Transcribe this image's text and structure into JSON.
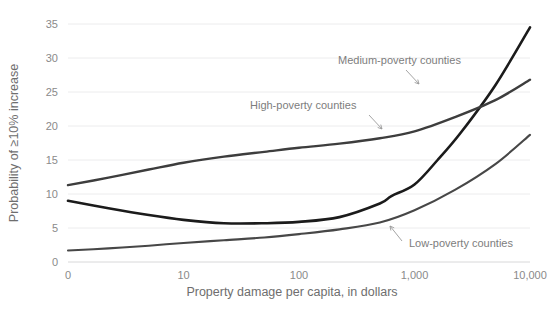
{
  "chart_data": {
    "type": "line",
    "title": "",
    "xlabel": "Property damage per capita, in dollars",
    "ylabel": "Probability of ≥10% increase",
    "x_tick_labels": [
      "0",
      "10",
      "100",
      "1,000",
      "10,000"
    ],
    "x_tick_positions": [
      0,
      1,
      2,
      3,
      4
    ],
    "y_tick_labels": [
      "0",
      "5",
      "10",
      "15",
      "20",
      "25",
      "30",
      "35"
    ],
    "ylim": [
      0,
      35
    ],
    "xlim": [
      0,
      4
    ],
    "grid": "horizontal",
    "legend": "annotations-inline",
    "series": [
      {
        "name": "High-poverty counties",
        "color": "#1b1b1b",
        "width": 2.6,
        "x": [
          0.0,
          0.35,
          0.7,
          1.0,
          1.35,
          1.7,
          2.0,
          2.35,
          2.7,
          2.8,
          3.0,
          3.2,
          3.4,
          3.7,
          4.0
        ],
        "values": [
          9.0,
          7.9,
          6.9,
          6.2,
          5.7,
          5.7,
          5.9,
          6.6,
          8.6,
          9.7,
          11.4,
          15.0,
          19.0,
          26.0,
          34.5
        ]
      },
      {
        "name": "Medium-poverty counties",
        "color": "#3d3d3d",
        "width": 2.4,
        "x": [
          0.0,
          0.35,
          0.7,
          1.0,
          1.35,
          1.7,
          2.0,
          2.35,
          2.7,
          3.0,
          3.35,
          3.7,
          4.0
        ],
        "values": [
          11.3,
          12.4,
          13.6,
          14.6,
          15.5,
          16.2,
          16.8,
          17.4,
          18.2,
          19.2,
          21.3,
          23.8,
          26.8
        ]
      },
      {
        "name": "Low-poverty counties",
        "color": "#474747",
        "width": 2.1,
        "x": [
          0.0,
          0.35,
          0.7,
          1.0,
          1.35,
          1.7,
          2.0,
          2.35,
          2.7,
          3.0,
          3.35,
          3.7,
          4.0
        ],
        "values": [
          1.7,
          2.0,
          2.4,
          2.8,
          3.2,
          3.6,
          4.1,
          4.8,
          5.8,
          7.6,
          10.6,
          14.4,
          18.7
        ]
      }
    ],
    "annotations": [
      {
        "id": "medium",
        "label": "Medium-poverty counties",
        "text_x": 338,
        "text_y": 64,
        "leader": "M 406 70 L 419 84"
      },
      {
        "id": "high",
        "label": "High-poverty counties",
        "text_x": 250,
        "text_y": 109,
        "leader": "M 369 115 L 382 129"
      },
      {
        "id": "low",
        "label": "Low-poverty counties",
        "text_x": 409,
        "text_y": 247,
        "leader": "M 402 241 L 390 226"
      }
    ]
  },
  "page": {
    "ghost_title": ""
  }
}
